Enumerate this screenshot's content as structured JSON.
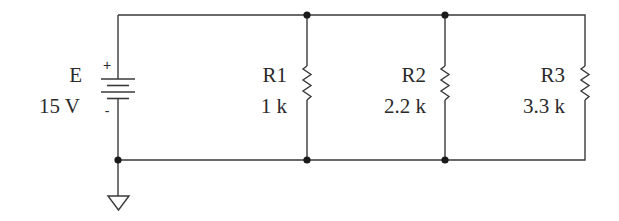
{
  "diagram": {
    "type": "parallel resistor circuit",
    "source": {
      "name": "E",
      "value": "15 V",
      "plus_sign": "+",
      "minus_sign": "-"
    },
    "resistors": [
      {
        "name": "R1",
        "value": "1 k"
      },
      {
        "name": "R2",
        "value": "2.2 k"
      },
      {
        "name": "R3",
        "value": "3.3 k"
      }
    ],
    "ground": "ground-symbol",
    "colors": {
      "line": "#3a3a3a",
      "node": "#1a1a1a",
      "text": "#2a2a2a",
      "background": "#ffffff"
    }
  }
}
